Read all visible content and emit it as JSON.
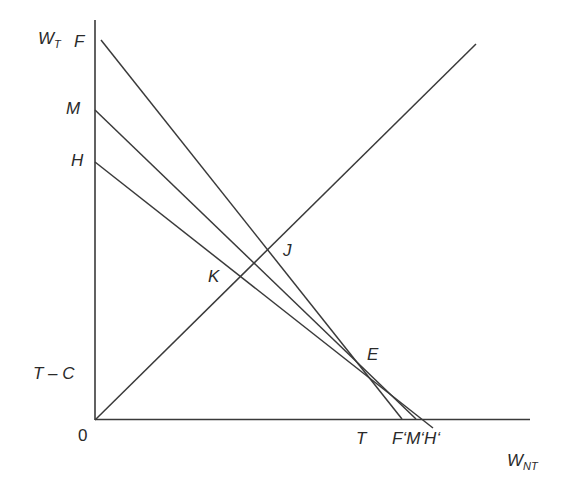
{
  "diagram": {
    "axes": {
      "y_label": "W",
      "y_label_sub": "T",
      "x_label": "W",
      "x_label_sub": "NT",
      "origin_label": "0"
    },
    "y_axis_labels": {
      "F": "F",
      "M": "M",
      "H": "H",
      "TC": "T – C"
    },
    "x_axis_labels": {
      "T": "T",
      "FMH": "F‘M‘H‘"
    },
    "points": {
      "J": "J",
      "K": "K",
      "E": "E"
    },
    "lines": [
      {
        "name": "FF'",
        "from": [
          101,
          40
        ],
        "to": [
          402,
          419
        ]
      },
      {
        "name": "MM'",
        "from": [
          95,
          110
        ],
        "to": [
          416,
          419
        ]
      },
      {
        "name": "HH'",
        "from": [
          95,
          162
        ],
        "to": [
          433,
          428
        ]
      },
      {
        "name": "45-degree line",
        "from": [
          95,
          420
        ],
        "to": [
          476,
          44
        ]
      }
    ],
    "line_color": "#3a3a3a"
  }
}
